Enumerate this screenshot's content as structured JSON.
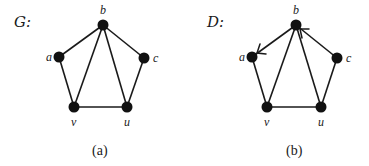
{
  "figures": [
    {
      "id": "a",
      "title": "G:",
      "caption": "(a)",
      "directed": false,
      "nodes": [
        {
          "id": "b",
          "label": "b"
        },
        {
          "id": "a",
          "label": "a"
        },
        {
          "id": "c",
          "label": "c"
        },
        {
          "id": "v",
          "label": "v"
        },
        {
          "id": "u",
          "label": "u"
        }
      ],
      "edges": [
        [
          "b",
          "a"
        ],
        [
          "b",
          "c"
        ],
        [
          "b",
          "v"
        ],
        [
          "b",
          "u"
        ],
        [
          "a",
          "v"
        ],
        [
          "c",
          "u"
        ],
        [
          "v",
          "u"
        ]
      ]
    },
    {
      "id": "b",
      "title": "D:",
      "caption": "(b)",
      "directed": true,
      "nodes": [
        {
          "id": "b",
          "label": "b"
        },
        {
          "id": "a",
          "label": "a"
        },
        {
          "id": "c",
          "label": "c"
        },
        {
          "id": "v",
          "label": "v"
        },
        {
          "id": "u",
          "label": "u"
        }
      ],
      "edges": [
        {
          "from": "b",
          "to": "a",
          "arrow": true
        },
        {
          "from": "c",
          "to": "b",
          "arrow": true
        },
        {
          "from": "b",
          "to": "v",
          "arrow": false
        },
        {
          "from": "b",
          "to": "u",
          "arrow": false
        },
        {
          "from": "a",
          "to": "v",
          "arrow": false
        },
        {
          "from": "c",
          "to": "u",
          "arrow": false
        },
        {
          "from": "v",
          "to": "u",
          "arrow": false
        }
      ]
    }
  ],
  "colors": {
    "ink": "#111111",
    "background": "#ffffff"
  }
}
